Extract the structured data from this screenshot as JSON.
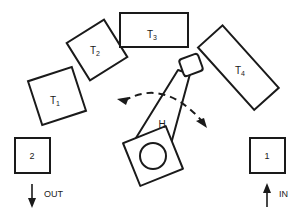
{
  "diagram": {
    "background_color": "#ffffff",
    "line_color": "#1a1a1a",
    "machines": [
      {
        "id": "T1",
        "label": "T",
        "subscript": "1",
        "shape": "square",
        "rotation_deg": -18,
        "center": [
          57,
          96
        ],
        "size": [
          46,
          46
        ],
        "label_pos": [
          55,
          100
        ]
      },
      {
        "id": "T2",
        "label": "T",
        "subscript": "2",
        "shape": "square",
        "rotation_deg": -32,
        "center": [
          97,
          50
        ],
        "size": [
          44,
          44
        ],
        "label_pos": [
          95,
          50
        ]
      },
      {
        "id": "T3",
        "label": "T",
        "subscript": "3",
        "shape": "rectangle",
        "rotation_deg": 0,
        "center": [
          154,
          30
        ],
        "size": [
          68,
          34
        ],
        "label_pos": [
          152,
          34
        ]
      },
      {
        "id": "T4",
        "label": "T",
        "subscript": "4",
        "shape": "rectangle",
        "rotation_deg": 48,
        "center": [
          238,
          68
        ],
        "size": [
          84,
          33
        ],
        "label_pos": [
          240,
          70
        ]
      }
    ],
    "robot": {
      "id": "H",
      "label": "H",
      "label_pos": [
        162,
        124
      ],
      "base_center": [
        152,
        155
      ],
      "base_size": [
        44,
        44
      ],
      "base_rotation_deg": -22,
      "pivot_center": [
        153,
        156
      ],
      "pivot_radius": 13,
      "gripper_center": [
        191,
        65
      ],
      "gripper_size": [
        20,
        18
      ],
      "gripper_rotation_deg": -20,
      "sweep_arc": {
        "start": [
          120,
          100
        ],
        "end": [
          204,
          124
        ],
        "style": "dashed",
        "arrowheads": "both"
      }
    },
    "stations": [
      {
        "id": "station-2",
        "label": "2",
        "role": "output",
        "rect": [
          15,
          138,
          35,
          35
        ],
        "label_pos": [
          32,
          156
        ]
      },
      {
        "id": "station-1",
        "label": "1",
        "role": "input",
        "rect": [
          250,
          138,
          35,
          35
        ],
        "label_pos": [
          267,
          156
        ]
      }
    ],
    "flows": [
      {
        "id": "flow-out",
        "label": "OUT",
        "direction": "down",
        "line": [
          32,
          184,
          32,
          207
        ],
        "label_pos": [
          44,
          195
        ]
      },
      {
        "id": "flow-in",
        "label": "IN",
        "direction": "up",
        "line": [
          267,
          207,
          267,
          184
        ],
        "label_pos": [
          279,
          195
        ]
      }
    ]
  }
}
